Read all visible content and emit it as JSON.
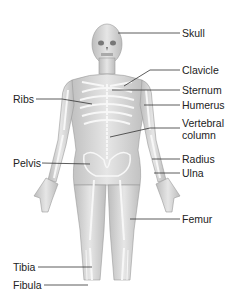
{
  "labels_right": [
    {
      "text": "Skull",
      "x": 182,
      "y": 27
    },
    {
      "text": "Clavicle",
      "x": 182,
      "y": 64
    },
    {
      "text": "Sternum",
      "x": 182,
      "y": 84
    },
    {
      "text": "Humerus",
      "x": 182,
      "y": 99
    },
    {
      "text": "Vertebral",
      "x": 182,
      "y": 117
    },
    {
      "text": "column",
      "x": 182,
      "y": 129
    },
    {
      "text": "Radius",
      "x": 182,
      "y": 153
    },
    {
      "text": "Ulna",
      "x": 182,
      "y": 167
    },
    {
      "text": "Femur",
      "x": 182,
      "y": 213
    }
  ],
  "labels_left": [
    {
      "text": "Ribs",
      "x": 13,
      "y": 93
    },
    {
      "text": "Pelvis",
      "x": 13,
      "y": 157
    },
    {
      "text": "Tibia",
      "x": 13,
      "y": 261
    },
    {
      "text": "Fibula",
      "x": 13,
      "y": 279
    }
  ],
  "colors": {
    "skin": "#d9d9d9",
    "bone": "#f2f2f2",
    "shadow": "#a8a8a8",
    "line": "#333333",
    "text": "#222222"
  }
}
